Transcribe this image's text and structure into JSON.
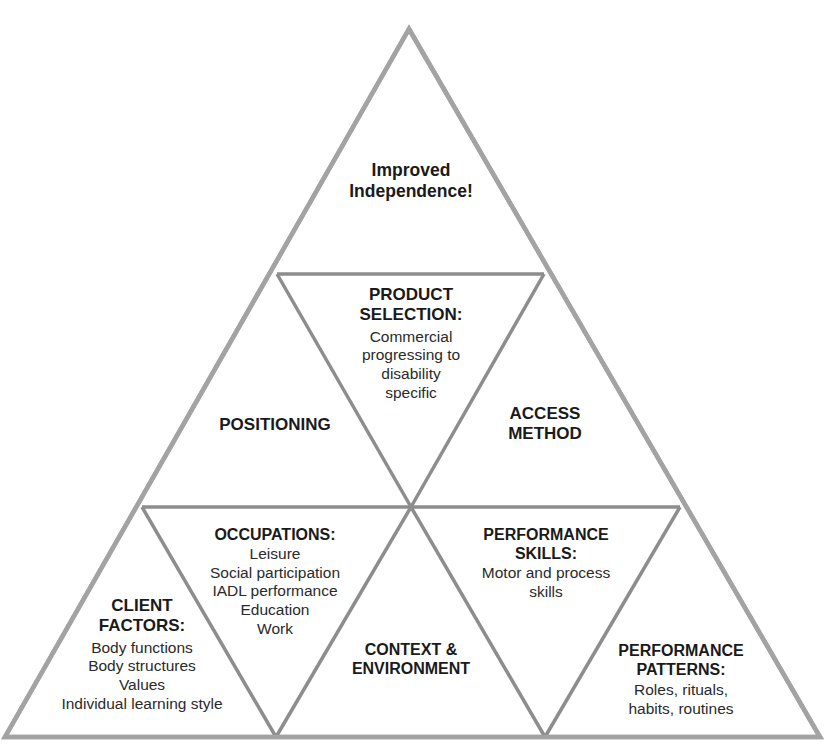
{
  "diagram": {
    "type": "triangular-pyramid",
    "line_colors": {
      "outer": "#a3a3a3",
      "inner": "#8d8d8d"
    },
    "background": "#ffffff",
    "tiers": [
      {
        "level": "top",
        "cells": [
          {
            "id": "improved-independence",
            "title_lines": [
              "Improved",
              "Independence!"
            ],
            "body_lines": []
          }
        ]
      },
      {
        "level": "middle",
        "cells": [
          {
            "id": "positioning",
            "title_lines": [
              "POSITIONING"
            ],
            "body_lines": []
          },
          {
            "id": "product-selection",
            "title_lines": [
              "PRODUCT",
              "SELECTION:"
            ],
            "body_lines": [
              "Commercial",
              "progressing to",
              "disability",
              "specific"
            ]
          },
          {
            "id": "access-method",
            "title_lines": [
              "ACCESS",
              "METHOD"
            ],
            "body_lines": []
          }
        ]
      },
      {
        "level": "bottom",
        "cells": [
          {
            "id": "client-factors",
            "title_lines": [
              "CLIENT",
              "FACTORS:"
            ],
            "body_lines": [
              "Body functions",
              "Body structures",
              "Values",
              "Individual learning style"
            ]
          },
          {
            "id": "occupations",
            "title_lines": [
              "OCCUPATIONS:"
            ],
            "body_lines": [
              "Leisure",
              "Social participation",
              "IADL performance",
              "Education",
              "Work"
            ]
          },
          {
            "id": "context-environment",
            "title_lines": [
              "CONTEXT &",
              "ENVIRONMENT"
            ],
            "body_lines": []
          },
          {
            "id": "performance-skills",
            "title_lines": [
              "PERFORMANCE",
              "SKILLS:"
            ],
            "body_lines": [
              "Motor and process",
              "skills"
            ]
          },
          {
            "id": "performance-patterns",
            "title_lines": [
              "PERFORMANCE",
              "PATTERNS:"
            ],
            "body_lines": [
              "Roles, rituals,",
              "habits, routines"
            ]
          }
        ]
      }
    ]
  }
}
